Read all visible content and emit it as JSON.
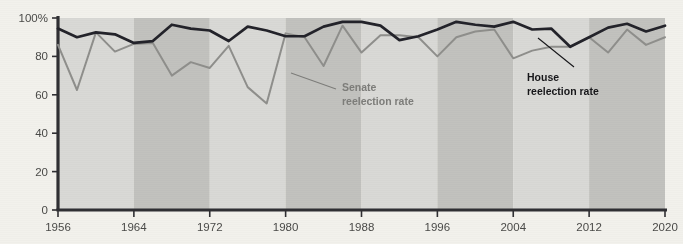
{
  "chart_data": {
    "type": "line",
    "title": "",
    "subtitle": "",
    "xlabel": "",
    "ylabel": "",
    "xlim": [
      1956,
      2020
    ],
    "ylim": [
      0,
      100
    ],
    "grid": false,
    "legend_position": "inline-annotations",
    "x_tick_labels": [
      "1956",
      "1964",
      "1972",
      "1980",
      "1988",
      "1996",
      "2004",
      "2012",
      "2020"
    ],
    "x_tick_values": [
      1956,
      1964,
      1972,
      1980,
      1988,
      1996,
      2004,
      2012,
      2020
    ],
    "y_tick_labels": [
      "0",
      "20",
      "40",
      "60",
      "80",
      "100%"
    ],
    "y_tick_values": [
      0,
      20,
      40,
      60,
      80,
      100
    ],
    "x": [
      1956,
      1958,
      1960,
      1962,
      1964,
      1966,
      1968,
      1970,
      1972,
      1974,
      1976,
      1978,
      1980,
      1982,
      1984,
      1986,
      1988,
      1990,
      1992,
      1994,
      1996,
      1998,
      2000,
      2002,
      2004,
      2006,
      2008,
      2010,
      2012,
      2014,
      2016,
      2018,
      2020
    ],
    "series": [
      {
        "name": "House reelection rate",
        "color": "#23232a",
        "values": [
          94.5,
          90,
          92.5,
          91.5,
          87,
          88,
          96.5,
          94.5,
          93.5,
          88,
          95.5,
          93.5,
          90.5,
          90.5,
          95.5,
          98,
          98,
          96,
          88.5,
          90.5,
          94,
          98,
          96.5,
          95.5,
          98,
          94,
          94.5,
          85,
          90,
          95,
          97,
          93,
          96
        ]
      },
      {
        "name": "Senate reelection rate",
        "color": "#8f8f8c",
        "values": [
          86,
          62.5,
          92.5,
          82.5,
          86.5,
          87,
          70,
          77,
          74,
          85.5,
          64,
          55.5,
          92,
          90,
          75,
          96,
          82,
          91,
          91,
          90,
          80,
          90,
          93,
          94,
          79,
          83,
          85,
          85,
          90,
          82,
          94,
          86,
          90
        ]
      }
    ],
    "annotations": [
      {
        "id": "senate-annotation",
        "label_line1": "Senate",
        "label_line2": "reelection rate",
        "color": "#7d7d7a"
      },
      {
        "id": "house-annotation",
        "label_line1": "House",
        "label_line2": "reelection rate",
        "color": "#17171a"
      }
    ],
    "background_bands": {
      "description": "alternating 8-year vertical shading bands",
      "light_color": "#d9d9d6",
      "dark_color": "#c2c2be"
    },
    "axis_color": "#2f2f33",
    "page_background": "#f2f1ec"
  }
}
